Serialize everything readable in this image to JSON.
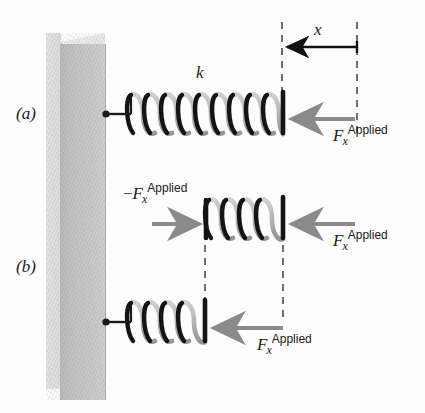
{
  "figure": {
    "background_color": "#fdfdfd"
  },
  "colors": {
    "wall_front": "#c3c3c3",
    "wall_side": "#e0e0e0",
    "spring_dark": "#1a1a1a",
    "spring_light": "#bdbdbd",
    "force_arrow": "#8a8a8a",
    "displacement_arrow": "#111111",
    "dashed_line": "#4a4a4a",
    "text": "#1a1a1a"
  },
  "panels": [
    {
      "id": "a",
      "label": "(a)",
      "spring_constant_label": "k",
      "displacement_label": "x",
      "forces": [
        {
          "id": "a-applied-right",
          "symbol": "F",
          "subscript": "x",
          "superscript": "Applied",
          "sign": "",
          "direction": "left"
        }
      ]
    },
    {
      "id": "b",
      "label": "(b)",
      "forces": [
        {
          "id": "b-applied-left",
          "symbol": "F",
          "subscript": "x",
          "superscript": "Applied",
          "sign": "−",
          "direction": "right"
        },
        {
          "id": "b-applied-right",
          "symbol": "F",
          "subscript": "x",
          "superscript": "Applied",
          "sign": "",
          "direction": "left"
        },
        {
          "id": "b-applied-bottom",
          "symbol": "F",
          "subscript": "x",
          "superscript": "Applied",
          "sign": "",
          "direction": "left"
        }
      ]
    }
  ],
  "geometry": {
    "wall": {
      "x": 46,
      "y": 33,
      "width": 59,
      "height": 367
    },
    "springs": [
      {
        "id": "spring-a",
        "x1": 108,
        "x2": 283,
        "y": 113,
        "coils": 9,
        "amplitude": 23
      },
      {
        "id": "spring-b-middle",
        "x1": 205,
        "x2": 283,
        "y": 218,
        "coils": 5,
        "amplitude": 23
      },
      {
        "id": "spring-b-bottom",
        "x1": 108,
        "x2": 205,
        "y": 322,
        "coils": 5,
        "amplitude": 23
      }
    ],
    "dashed_lines": [
      {
        "id": "dash-a-left",
        "x": 282,
        "y1": 22,
        "y2": 135
      },
      {
        "id": "dash-a-right",
        "x": 357,
        "y1": 22,
        "y2": 135
      },
      {
        "id": "dash-b-left",
        "x": 205,
        "y1": 232,
        "y2": 320
      },
      {
        "id": "dash-b-right",
        "x": 283,
        "y1": 232,
        "y2": 320
      }
    ]
  }
}
